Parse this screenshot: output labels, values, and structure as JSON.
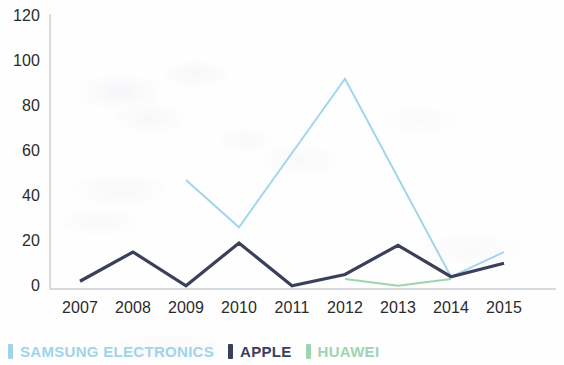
{
  "chart_data": {
    "type": "line",
    "title": "",
    "subtitle": "",
    "xlabel": "",
    "ylabel": "",
    "x": [
      "2007",
      "2008",
      "2009",
      "2010",
      "2011",
      "2012",
      "2013",
      "2014",
      "2015"
    ],
    "xlim": [
      "2007",
      "2015"
    ],
    "ylim": [
      0,
      120
    ],
    "yticks": [
      0,
      20,
      40,
      60,
      80,
      100,
      120
    ],
    "ytick_labels": [
      "0",
      "20",
      "40",
      "60",
      "80",
      "100",
      "120"
    ],
    "grid": false,
    "legend_position": "bottom-left",
    "series": [
      {
        "name": "SAMSUNG ELECTRONICS",
        "color": "#9fd4ea",
        "values": [
          null,
          null,
          48,
          27,
          60,
          93,
          49,
          5,
          16
        ]
      },
      {
        "name": "APPLE",
        "color": "#3a3f5c",
        "values": [
          3,
          16,
          1,
          20,
          1,
          6,
          19,
          5,
          11
        ]
      },
      {
        "name": "HUAWEI",
        "color": "#9ed4b1",
        "values": [
          null,
          null,
          null,
          null,
          null,
          4,
          1,
          4,
          null
        ]
      }
    ]
  },
  "legend": {
    "items": [
      {
        "label": "SAMSUNG ELECTRONICS",
        "color": "#9fd4ea"
      },
      {
        "label": "APPLE",
        "color": "#3a3f5c"
      },
      {
        "label": "HUAWEI",
        "color": "#9ed4b1"
      }
    ]
  },
  "axis": {
    "line_color": "#c9ccd2"
  }
}
